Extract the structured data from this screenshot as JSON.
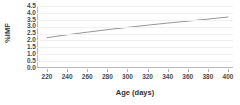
{
  "chart_data": {
    "type": "line",
    "title": "",
    "xlabel": "Age (days)",
    "ylabel": "%IMF",
    "xlim": [
      210,
      405
    ],
    "ylim": [
      0.0,
      4.5
    ],
    "grid": true,
    "legend": "none",
    "xticks": [
      "220",
      "240",
      "260",
      "280",
      "300",
      "320",
      "340",
      "360",
      "380",
      "400"
    ],
    "xtick_values": [
      220,
      240,
      260,
      280,
      300,
      320,
      340,
      360,
      380,
      400
    ],
    "yticks": [
      "4.5",
      "4.0",
      "3.5",
      "3.0",
      "2.5",
      "2.0",
      "1.5",
      "1.0",
      "0.5",
      "0.0"
    ],
    "ytick_values": [
      4.5,
      4.0,
      3.5,
      3.0,
      2.5,
      2.0,
      1.5,
      1.0,
      0.5,
      0.0
    ],
    "series": [
      {
        "name": "%IMF vs Age",
        "color": "#8a8a8a",
        "x": [
          220,
          240,
          260,
          280,
          300,
          320,
          340,
          360,
          380,
          400
        ],
        "values": [
          2.2,
          2.41,
          2.6,
          2.78,
          2.95,
          3.11,
          3.26,
          3.4,
          3.55,
          3.7
        ]
      }
    ]
  }
}
